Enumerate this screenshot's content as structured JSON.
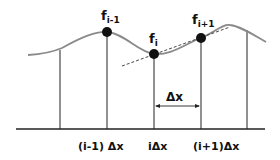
{
  "diagram": {
    "type": "finite-difference-sampling",
    "points": [
      {
        "id": "f_im1",
        "label": "f",
        "sub": "i-1"
      },
      {
        "id": "f_i",
        "label": "f",
        "sub": "i"
      },
      {
        "id": "f_ip1",
        "label": "f",
        "sub": "i+1"
      }
    ],
    "axis_labels": [
      "(i-1) Δx",
      "iΔx",
      "(i+1)Δx"
    ],
    "spacing_label": "Δx",
    "colors": {
      "curve": "#8a8a8a",
      "lines": "#222222",
      "dots": "#111111",
      "tangent": "#333333"
    }
  }
}
